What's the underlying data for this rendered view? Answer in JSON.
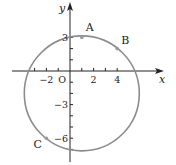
{
  "diagram": {
    "type": "coordinate-circle",
    "axes": {
      "x_label": "x",
      "y_label": "y",
      "origin_label": "O",
      "x_range": [
        -5,
        7
      ],
      "y_range": [
        -8,
        5
      ],
      "x_ticks": [
        -3,
        -2,
        -1,
        1,
        2,
        3,
        4
      ],
      "x_tick_labels": [
        {
          "value": -2,
          "text": "−2"
        },
        {
          "value": 2,
          "text": "2"
        },
        {
          "value": 4,
          "text": "4"
        }
      ],
      "y_ticks": [
        3,
        2,
        1,
        -1,
        -2,
        -3,
        -4,
        -5,
        -6,
        -7
      ],
      "y_tick_labels": [
        {
          "value": 3,
          "text": "3"
        },
        {
          "value": -3,
          "text": "−3"
        },
        {
          "value": -6,
          "text": "−6"
        }
      ]
    },
    "circle": {
      "center": [
        1,
        -2
      ],
      "radius": 5,
      "color": "#8c8c8c"
    },
    "points": [
      {
        "label": "A",
        "x": 1,
        "y": 3
      },
      {
        "label": "B",
        "x": 4,
        "y": 2
      },
      {
        "label": "C",
        "x": -2,
        "y": -6
      }
    ]
  }
}
